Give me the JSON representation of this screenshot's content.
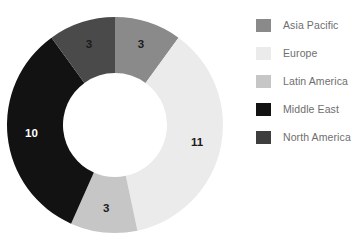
{
  "chart_data": {
    "type": "pie",
    "variant": "donut",
    "title": "",
    "xlabel": "",
    "ylabel": "",
    "total": 30,
    "legend_position": "right",
    "grid": false,
    "start_angle_deg": 0,
    "direction": "clockwise",
    "categories": [
      "Asia Pacific",
      "Europe",
      "Latin America",
      "Middle East",
      "North America"
    ],
    "values": [
      3,
      11,
      3,
      10,
      3
    ],
    "slices": [
      {
        "label": "Asia Pacific",
        "value": 3,
        "value_text": "3",
        "color": "#8a8a8a",
        "label_color": "#1c1c1c",
        "start_deg": 0,
        "end_deg": 36
      },
      {
        "label": "Europe",
        "value": 11,
        "value_text": "11",
        "color": "#ebebeb",
        "label_color": "#1c1c1c",
        "start_deg": 36,
        "end_deg": 168
      },
      {
        "label": "Latin America",
        "value": 3,
        "value_text": "3",
        "color": "#c6c6c6",
        "label_color": "#1c1c1c",
        "start_deg": 168,
        "end_deg": 204
      },
      {
        "label": "Middle East",
        "value": 10,
        "value_text": "10",
        "color": "#121212",
        "label_color": "#ffffff",
        "start_deg": 204,
        "end_deg": 324
      },
      {
        "label": "North America",
        "value": 3,
        "value_text": "3",
        "color": "#4a4a4a",
        "label_color": "#1c1c1c",
        "start_deg": 324,
        "end_deg": 360
      }
    ]
  },
  "legend": {
    "items": [
      {
        "label": "Asia Pacific",
        "color": "#8a8a8a"
      },
      {
        "label": "Europe",
        "color": "#ebebeb"
      },
      {
        "label": "Latin America",
        "color": "#c6c6c6"
      },
      {
        "label": "Middle East",
        "color": "#121212"
      },
      {
        "label": "North America",
        "color": "#3e3e3e"
      }
    ]
  },
  "geometry": {
    "center_x": 115,
    "center_y": 125,
    "outer_radius": 108,
    "inner_radius": 52,
    "label_radius": 84
  }
}
